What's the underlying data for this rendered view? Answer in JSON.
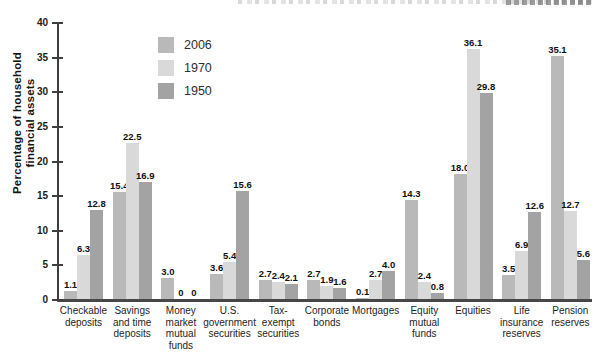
{
  "chart_data": {
    "type": "bar",
    "title": "",
    "ylabel_lines": [
      "Percentage of household",
      "financial assets"
    ],
    "ylim": [
      0,
      40
    ],
    "yticks": [
      0,
      5,
      10,
      15,
      20,
      25,
      30,
      35,
      40
    ],
    "grid": false,
    "legend_position": "upper-left-inside",
    "categories": [
      [
        "Checkable",
        "deposits"
      ],
      [
        "Savings",
        "and time",
        "deposits"
      ],
      [
        "Money",
        "market",
        "mutual",
        "funds"
      ],
      [
        "U.S.",
        "government",
        "securities"
      ],
      [
        "Tax-",
        "exempt",
        "securities"
      ],
      [
        "Corporate",
        "bonds"
      ],
      [
        "Mortgages"
      ],
      [
        "Equity",
        "mutual",
        "funds"
      ],
      [
        "Equities"
      ],
      [
        "Life",
        "insurance",
        "reserves"
      ],
      [
        "Pension",
        "reserves"
      ]
    ],
    "series": [
      {
        "name": "2006",
        "color": "#b9b9b9",
        "values": [
          1.1,
          15.4,
          3.0,
          3.6,
          2.7,
          2.7,
          0.1,
          14.3,
          18.0,
          3.5,
          35.1
        ],
        "labels": [
          "1.1",
          "15.4",
          "3.0",
          "3.6",
          "2.7",
          "2.7",
          "0.1",
          "14.3",
          "18.0",
          "3.5",
          "35.1"
        ]
      },
      {
        "name": "1970",
        "color": "#d9d9d9",
        "values": [
          6.3,
          22.5,
          0,
          5.4,
          2.4,
          1.9,
          2.7,
          2.4,
          36.1,
          6.9,
          12.7
        ],
        "labels": [
          "6.3",
          "22.5",
          "0",
          "5.4",
          "2.4",
          "1.9",
          "2.7",
          "2.4",
          "36.1",
          "6.9",
          "12.7"
        ]
      },
      {
        "name": "1950",
        "color": "#a3a3a3",
        "values": [
          12.8,
          16.9,
          0,
          15.6,
          2.1,
          1.6,
          4.0,
          0.8,
          29.8,
          12.6,
          5.6
        ],
        "labels": [
          "12.8",
          "16.9",
          "0",
          "15.6",
          "2.1",
          "1.6",
          "4.0",
          "0.8",
          "29.8",
          "12.6",
          "5.6"
        ]
      }
    ],
    "axis_color": "#3f3f3f",
    "value_label_color": "#111111"
  }
}
